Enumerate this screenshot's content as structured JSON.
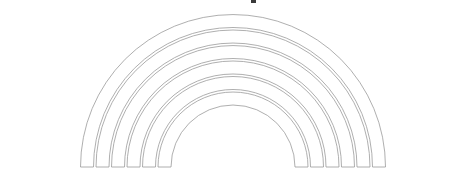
{
  "figure": {
    "type": "line-art-diagram",
    "shape": "nested-semicircular-arches",
    "background_color": "#ffffff",
    "stroke_color": "#9a9a9a",
    "stroke_width": 0.8,
    "band_fill": "#ffffff",
    "canvas": {
      "width": 465,
      "height": 180
    },
    "center": {
      "x": 233,
      "y": 167
    },
    "band_count": 6,
    "band_thickness": 13,
    "band_gap": 2.5,
    "bands": [
      {
        "index": 1,
        "label": "band-1-innermost",
        "inner_radius": 62,
        "outer_radius": 75,
        "left_foot_x": 158,
        "right_foot_x": 308,
        "apex_y": 92
      },
      {
        "index": 2,
        "label": "band-2",
        "inner_radius": 77.5,
        "outer_radius": 90.5,
        "left_foot_x": 142,
        "right_foot_x": 324,
        "apex_y": 76
      },
      {
        "index": 3,
        "label": "band-3",
        "inner_radius": 93,
        "outer_radius": 106,
        "left_foot_x": 127,
        "right_foot_x": 339,
        "apex_y": 61
      },
      {
        "index": 4,
        "label": "band-4",
        "inner_radius": 108.5,
        "outer_radius": 121.5,
        "left_foot_x": 111,
        "right_foot_x": 355,
        "apex_y": 45
      },
      {
        "index": 5,
        "label": "band-5",
        "inner_radius": 124,
        "outer_radius": 137,
        "left_foot_x": 96,
        "right_foot_x": 370,
        "apex_y": 30
      },
      {
        "index": 6,
        "label": "band-6-outermost",
        "inner_radius": 139.5,
        "outer_radius": 152.5,
        "left_foot_x": 80,
        "right_foot_x": 386,
        "apex_y": 14
      }
    ],
    "baseline_y": 167,
    "artifact": {
      "label": "top-edge-mark",
      "x": 251,
      "y": 0,
      "width": 5,
      "height": 3,
      "color": "#3a3a3a"
    }
  }
}
